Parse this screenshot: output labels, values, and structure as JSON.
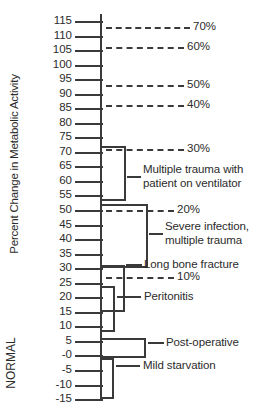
{
  "chart_data": {
    "type": "bar",
    "title": "",
    "subtitle": "",
    "xlabel": "",
    "ylabel": "Percent Change in Metabolic Activity",
    "ylim": [
      -15,
      115
    ],
    "grid": false,
    "legend": null,
    "orientation": "horizontal-range-bars",
    "y_tick_labels": [
      "115",
      "110",
      "105",
      "100",
      "95",
      "90",
      "85",
      "80",
      "75",
      "70",
      "65",
      "60",
      "55",
      "50",
      "45",
      "40",
      "35",
      "30",
      "25",
      "20",
      "15",
      "10",
      "5",
      "-0",
      "-5",
      "-10",
      "-15"
    ],
    "y_tick_values": [
      115,
      110,
      105,
      100,
      95,
      90,
      85,
      80,
      75,
      70,
      65,
      60,
      55,
      50,
      45,
      40,
      35,
      30,
      25,
      20,
      15,
      10,
      5,
      0,
      -5,
      -10,
      -15
    ],
    "reference_lines": [
      {
        "label": "70%",
        "value": 113
      },
      {
        "label": "60%",
        "value": 106
      },
      {
        "label": "50%",
        "value": 93
      },
      {
        "label": "40%",
        "value": 86
      },
      {
        "label": "30%",
        "value": 71
      },
      {
        "label": "20%",
        "value": 50
      },
      {
        "label": "10%",
        "value": 27
      }
    ],
    "categories": [
      {
        "label": "Multiple trauma with patient on ventilator",
        "label_line1": "Multiple trauma with",
        "label_line2": "patient on ventilator",
        "range": [
          53,
          72
        ]
      },
      {
        "label": "Severe infection, multiple trauma",
        "label_line1": "Severe infection,",
        "label_line2": "multiple trauma",
        "range": [
          30,
          52
        ]
      },
      {
        "label": "Long bone fracture",
        "label_line1": "Long bone fracture",
        "label_line2": "",
        "range": [
          15,
          31
        ]
      },
      {
        "label": "Peritonitis",
        "label_line1": "Peritonitis",
        "label_line2": "",
        "range": [
          8,
          24
        ]
      },
      {
        "label": "Post-operative",
        "label_line1": "Post-operative",
        "label_line2": "",
        "range": [
          -1,
          6
        ]
      },
      {
        "label": "Mild starvation",
        "label_line1": "Mild starvation",
        "label_line2": "",
        "range": [
          -15,
          -1
        ]
      }
    ],
    "annotations": [
      {
        "text": "NORMAL",
        "orientation": "vertical",
        "near_value": 0
      }
    ],
    "colors": {
      "line": "#3a3a3a",
      "text": "#2b2b2b",
      "background": "#ffffff"
    }
  }
}
